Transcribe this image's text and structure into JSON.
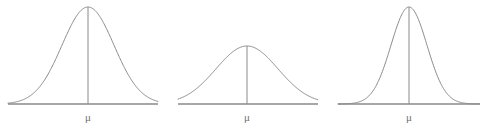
{
  "figure": {
    "background_color": "#ffffff",
    "stroke_color": "#8a8a8a",
    "label_color": "#6f6f6f",
    "width": 488,
    "height": 128
  },
  "chart_data": {
    "type": "line",
    "title": "",
    "subtitle": "",
    "xlabel": "",
    "ylabel": "",
    "grid": false,
    "legend": "none",
    "panels": [
      {
        "id": "panel-1",
        "center_label": "μ",
        "mean_x": 88,
        "peak_y": 7,
        "baseline_y": 104,
        "axis_start_x": 8,
        "axis_end_x": 158,
        "sigma_px": 26,
        "spread": "medium",
        "height": "tall",
        "label_x": 88,
        "label_y": 121
      },
      {
        "id": "panel-2",
        "center_label": "μ",
        "mean_x": 247,
        "peak_y": 46,
        "baseline_y": 104,
        "axis_start_x": 178,
        "axis_end_x": 318,
        "sigma_px": 31,
        "spread": "large",
        "height": "short",
        "label_x": 247,
        "label_y": 121
      },
      {
        "id": "panel-3",
        "center_label": "μ",
        "mean_x": 409,
        "peak_y": 7,
        "baseline_y": 104,
        "axis_start_x": 338,
        "axis_end_x": 480,
        "sigma_px": 18,
        "spread": "small",
        "height": "tall",
        "label_x": 409,
        "label_y": 121
      }
    ]
  }
}
